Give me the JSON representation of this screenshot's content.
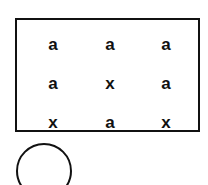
{
  "grid": {
    "rows": [
      [
        "a",
        "a",
        "a"
      ],
      [
        "a",
        "x",
        "a"
      ],
      [
        "x",
        "a",
        "x"
      ]
    ]
  },
  "shapes": {
    "circle": "circle"
  },
  "colors": {
    "stroke": "#111111",
    "background": "#ffffff"
  }
}
